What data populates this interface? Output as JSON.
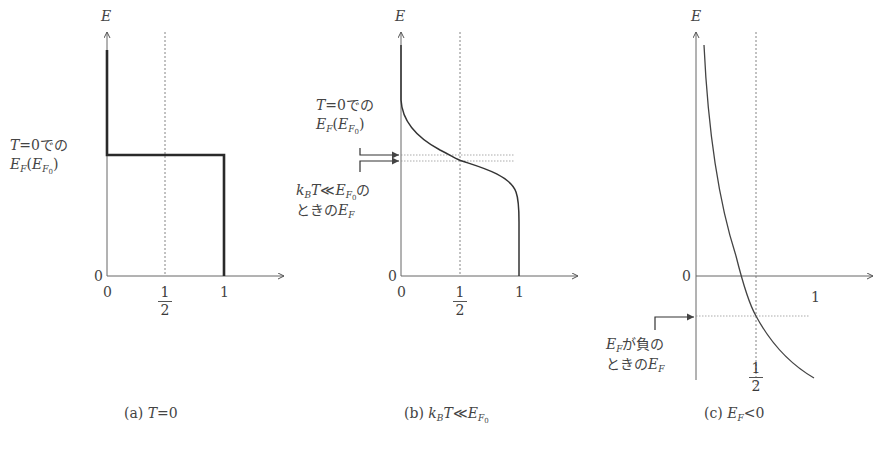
{
  "panels": [
    {
      "id": "a",
      "caption_prefix": "(a)",
      "caption_math": "T=0",
      "y_axis_label": "E",
      "origin_y_label": "0",
      "x_ticks": [
        "0",
        "1/2",
        "1"
      ],
      "half_num": "1",
      "half_den": "2",
      "annotation_line1": "T=0での",
      "annotation_line2": "E_F (E_F0)",
      "description": "Step function: occupancy 1 below E_F0, 0 above"
    },
    {
      "id": "b",
      "caption_prefix": "(b)",
      "caption_math": "k_B T ≪ E_F0",
      "y_axis_label": "E",
      "origin_y_label": "0",
      "x_ticks": [
        "0",
        "1/2",
        "1"
      ],
      "half_num": "1",
      "half_den": "2",
      "annotation_top_line1": "T=0での",
      "annotation_top_line2": "E_F (E_F0)",
      "annotation_bottom_line1": "k_B T ≪ E_F0 の",
      "annotation_bottom_line2": "ときの E_F",
      "description": "Smoothed Fermi-Dirac distribution; E_F slightly below E_F0"
    },
    {
      "id": "c",
      "caption_prefix": "(c)",
      "caption_math": "E_F < 0",
      "y_axis_label": "E",
      "origin_y_label": "0",
      "x_ticks": [
        "1/2",
        "1"
      ],
      "half_num": "1",
      "half_den": "2",
      "annotation_line1": "E_F が負の",
      "annotation_line2": "ときの E_F",
      "description": "Distribution with E_F negative; f=1/2 crossing below E=0"
    }
  ],
  "text": {
    "E": "E",
    "zero": "0",
    "one": "1",
    "T": "T",
    "eq0": "=0",
    "deno": "での",
    "EF_E": "E",
    "F": "F",
    "F0": "F",
    "zero_sub": "0",
    "kB_k": "k",
    "kB_B": "B",
    "ll": "≪",
    "no": "の",
    "tokino": "ときの",
    "ganegative": "が負の",
    "lt0": "<0",
    "open_paren": "(",
    "close_paren": ")"
  }
}
